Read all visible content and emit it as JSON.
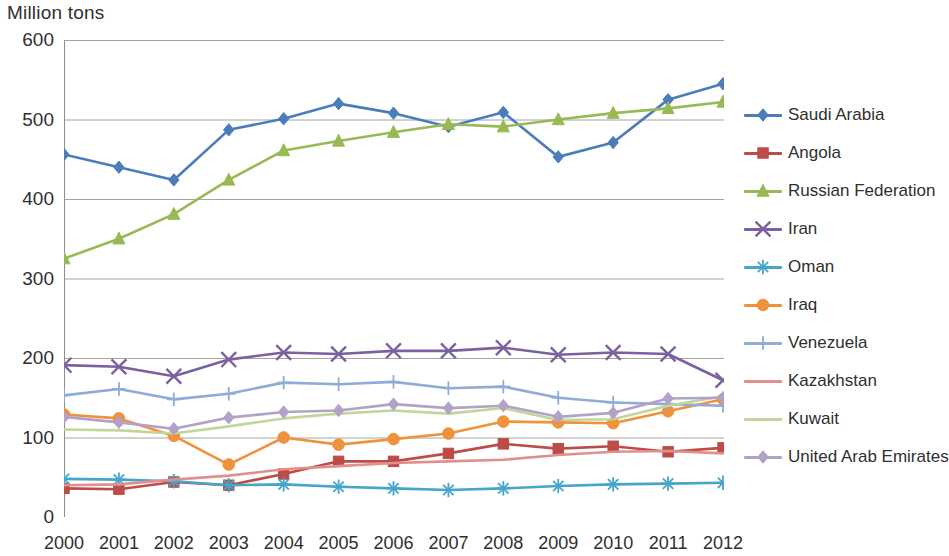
{
  "axis_title": "Million tons",
  "chart_data": {
    "type": "line",
    "title": "",
    "subtitle": "",
    "xlabel": "",
    "ylabel": "Million tons",
    "ylim": [
      0,
      600
    ],
    "ytick_step": 100,
    "yticks": [
      0,
      100,
      200,
      300,
      400,
      500,
      600
    ],
    "grid": true,
    "legend_position": "right",
    "categories": [
      2000,
      2001,
      2002,
      2003,
      2004,
      2005,
      2006,
      2007,
      2008,
      2009,
      2010,
      2011,
      2012
    ],
    "x": [
      "2000",
      "2001",
      "2002",
      "2003",
      "2004",
      "2005",
      "2006",
      "2007",
      "2008",
      "2009",
      "2010",
      "2011",
      "2012"
    ],
    "series": [
      {
        "name": "Saudi Arabia",
        "color": "#4A7EBB",
        "marker": "diamond",
        "values": [
          456,
          440,
          424,
          487,
          501,
          520,
          508,
          491,
          509,
          453,
          471,
          525,
          545
        ]
      },
      {
        "name": "Angola",
        "color": "#BE4B48",
        "marker": "square",
        "values": [
          36,
          35,
          44,
          40,
          54,
          70,
          70,
          80,
          92,
          86,
          89,
          82,
          87
        ]
      },
      {
        "name": "Russian Federation",
        "color": "#98B954",
        "marker": "triangle",
        "values": [
          325,
          350,
          381,
          424,
          461,
          473,
          484,
          494,
          491,
          500,
          508,
          514,
          522
        ]
      },
      {
        "name": "Iran",
        "color": "#7D60A0",
        "marker": "cross",
        "values": [
          191,
          189,
          177,
          198,
          207,
          205,
          209,
          209,
          213,
          204,
          207,
          205,
          172
        ]
      },
      {
        "name": "Oman",
        "color": "#46A5CB",
        "marker": "star",
        "values": [
          48,
          47,
          45,
          40,
          41,
          38,
          36,
          34,
          36,
          39,
          41,
          42,
          43
        ]
      },
      {
        "name": "Iraq",
        "color": "#F0913C",
        "marker": "circle",
        "values": [
          129,
          124,
          102,
          66,
          100,
          91,
          98,
          105,
          120,
          119,
          118,
          133,
          148
        ]
      },
      {
        "name": "Venezuela",
        "color": "#8EACD7",
        "marker": "plus",
        "values": [
          153,
          161,
          148,
          155,
          169,
          167,
          170,
          162,
          164,
          150,
          144,
          142,
          140
        ]
      },
      {
        "name": "Kazakhstan",
        "color": "#E0908C",
        "marker": "none",
        "values": [
          40,
          41,
          47,
          52,
          60,
          64,
          68,
          70,
          72,
          78,
          82,
          83,
          80
        ]
      },
      {
        "name": "Kuwait",
        "color": "#C2D69A",
        "marker": "none",
        "values": [
          110,
          109,
          105,
          114,
          124,
          130,
          134,
          130,
          137,
          122,
          123,
          140,
          152
        ]
      },
      {
        "name": "United Arab Emirates",
        "color": "#B3A2C7",
        "marker": "diamond",
        "values": [
          126,
          119,
          111,
          125,
          132,
          134,
          142,
          137,
          140,
          126,
          131,
          149,
          150
        ]
      }
    ]
  }
}
